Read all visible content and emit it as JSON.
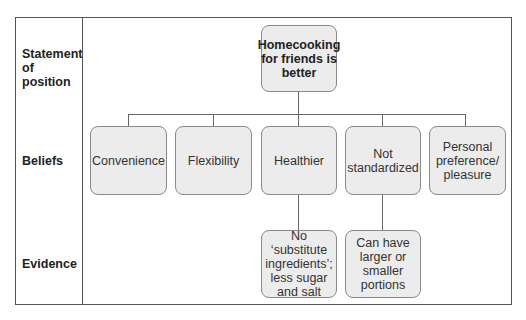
{
  "diagram": {
    "row_labels": {
      "statement": "Statement of position",
      "beliefs": "Beliefs",
      "evidence": "Evidence"
    },
    "statement": "Homecooking for friends is better",
    "beliefs": [
      {
        "label": "Convenience"
      },
      {
        "label": "Flexibility"
      },
      {
        "label": "Healthier"
      },
      {
        "label": "Not standardized"
      },
      {
        "label": "Personal preference/ pleasure"
      }
    ],
    "evidence": [
      {
        "parent": "Healthier",
        "label": "No ‘substitute ingredients’; less sugar and salt"
      },
      {
        "parent": "Not standardized",
        "label": "Can have larger or smaller portions"
      }
    ],
    "colors": {
      "box_fill": "#ececec",
      "box_border": "#8a8a8a",
      "lines": "#666666"
    }
  }
}
